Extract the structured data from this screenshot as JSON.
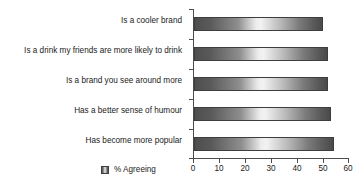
{
  "chart_data": {
    "type": "bar",
    "orientation": "horizontal",
    "title": "",
    "subtitle": "",
    "xlabel": "",
    "ylabel": "",
    "categories": [
      "Is a cooler brand",
      "Is a drink my friends are more likely to drink",
      "Is a brand you see around more",
      "Has a better sense of humour",
      "Has become more popular"
    ],
    "series": [
      {
        "name": "% Agreeing",
        "values": [
          50,
          52,
          52,
          53,
          54
        ]
      }
    ],
    "values": [
      50,
      52,
      52,
      53,
      54
    ],
    "xlim": [
      0,
      60
    ],
    "xticks": [
      0,
      10,
      20,
      30,
      40,
      50,
      60
    ],
    "xtick_labels": [
      "0",
      "10",
      "20",
      "30",
      "40",
      "50",
      "60"
    ],
    "grid": false,
    "legend": {
      "position": "bottom-left",
      "entries": [
        {
          "label": "% Agreeing",
          "swatch": "gradient-gray"
        }
      ]
    },
    "colors": {
      "bar_dark": "#4e4e4e",
      "bar_light": "#f2f2f2",
      "axis": "#4d4d4d",
      "text": "#1a1a1a",
      "background": "#ffffff"
    }
  }
}
